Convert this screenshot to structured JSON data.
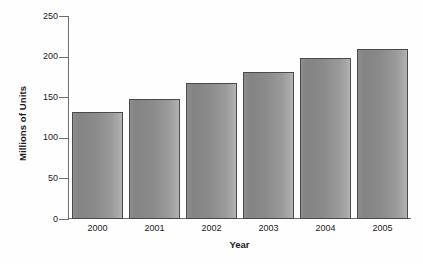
{
  "chart_data": {
    "type": "bar",
    "title": "",
    "xlabel": "Year",
    "ylabel": "Millions of Units",
    "categories": [
      "2000",
      "2001",
      "2002",
      "2003",
      "2004",
      "2005"
    ],
    "values": [
      132,
      148,
      167,
      181,
      198,
      209
    ],
    "ylim": [
      0,
      250
    ],
    "yticks": [
      0,
      50,
      100,
      150,
      200,
      250
    ],
    "ytick_labels": [
      "0",
      "50",
      "100",
      "150",
      "200",
      "250"
    ],
    "grid": false,
    "legend": null,
    "series": [
      {
        "name": "Millions of Units",
        "values": [
          132,
          148,
          167,
          181,
          198,
          209
        ]
      }
    ],
    "colors": {
      "bar_fill_dark": "#848484",
      "bar_fill_light": "#b4b4b4",
      "bar_border": "#4a4a4a",
      "axis": "#6e6e6e",
      "text": "#1b1b1b",
      "background": "#ffffff"
    }
  }
}
